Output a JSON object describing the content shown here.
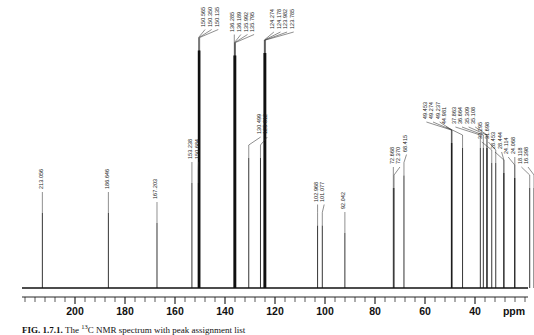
{
  "figure": {
    "caption_label": "FIG. 1.7.1.",
    "caption_text": "The 13C NMR spectrum with peak assignment list",
    "x_axis_unit": "ppm"
  },
  "axis": {
    "unit_label": "ppm",
    "tick_labels": [
      "200",
      "180",
      "160",
      "140",
      "120",
      "100",
      "80",
      "60",
      "40"
    ],
    "tick_values": [
      200,
      180,
      160,
      140,
      120,
      100,
      80,
      60,
      40
    ],
    "range_min": 8,
    "range_max": 220,
    "direction": "reversed",
    "minor_ticks_per_major": 4
  },
  "chart_data": {
    "type": "line",
    "title": "13C NMR spectrum",
    "xlabel": "ppm",
    "ylabel": "",
    "xlim": [
      220,
      8
    ],
    "ylim": [
      0,
      1
    ],
    "grid": false,
    "legend": "none",
    "x": [
      213.056,
      186.646,
      167.203,
      153.238,
      150.684,
      150.565,
      150.35,
      150.135,
      136.285,
      136.189,
      135.992,
      135.795,
      130.499,
      125.812,
      124.274,
      124.178,
      123.982,
      123.785,
      102.968,
      101.077,
      92.042,
      72.668,
      72.37,
      68.415,
      49.453,
      49.274,
      49.237,
      44.981,
      37.863,
      36.664,
      35.309,
      35.108,
      33.295,
      31.698,
      28.444,
      28.453,
      24.114,
      24.068,
      18.118,
      16.398
    ],
    "peaks": [
      {
        "ppm": 213.056,
        "label": "213.056",
        "height": 0.3
      },
      {
        "ppm": 186.646,
        "label": "186.646",
        "height": 0.3
      },
      {
        "ppm": 167.203,
        "label": "167.203",
        "height": 0.26
      },
      {
        "ppm": 153.238,
        "label": "153.238",
        "height": 0.42
      },
      {
        "ppm": 150.684,
        "label": "150.684",
        "height": 0.42
      },
      {
        "ppm": 150.565,
        "label": "150.565",
        "height": 0.95
      },
      {
        "ppm": 150.35,
        "label": "150.350",
        "height": 0.95
      },
      {
        "ppm": 150.135,
        "label": "150.135",
        "height": 0.95
      },
      {
        "ppm": 136.285,
        "label": "136.285",
        "height": 0.93
      },
      {
        "ppm": 136.189,
        "label": "136.189",
        "height": 0.93
      },
      {
        "ppm": 135.992,
        "label": "135.992",
        "height": 0.93
      },
      {
        "ppm": 135.795,
        "label": "135.795",
        "height": 0.93
      },
      {
        "ppm": 130.499,
        "label": "130.499",
        "height": 0.52
      },
      {
        "ppm": 125.812,
        "label": "125.812",
        "height": 0.52
      },
      {
        "ppm": 124.274,
        "label": "124.274",
        "height": 0.94
      },
      {
        "ppm": 124.178,
        "label": "124.178",
        "height": 0.94
      },
      {
        "ppm": 123.982,
        "label": "123.982",
        "height": 0.94
      },
      {
        "ppm": 123.785,
        "label": "123.785",
        "height": 0.94
      },
      {
        "ppm": 102.968,
        "label": "102.968",
        "height": 0.25
      },
      {
        "ppm": 101.077,
        "label": "101.077",
        "height": 0.25
      },
      {
        "ppm": 92.042,
        "label": "92.042",
        "height": 0.22
      },
      {
        "ppm": 72.668,
        "label": "72.668",
        "height": 0.4
      },
      {
        "ppm": 72.37,
        "label": "72.370",
        "height": 0.4
      },
      {
        "ppm": 68.415,
        "label": "68.415",
        "height": 0.45
      },
      {
        "ppm": 49.453,
        "label": "49.453",
        "height": 0.58
      },
      {
        "ppm": 49.274,
        "label": "49.274",
        "height": 0.58
      },
      {
        "ppm": 49.237,
        "label": "49.237",
        "height": 0.58
      },
      {
        "ppm": 44.981,
        "label": "44.981",
        "height": 0.56
      },
      {
        "ppm": 37.863,
        "label": "37.863",
        "height": 0.56
      },
      {
        "ppm": 36.664,
        "label": "36.664",
        "height": 0.56
      },
      {
        "ppm": 35.309,
        "label": "35.309",
        "height": 0.56
      },
      {
        "ppm": 35.108,
        "label": "35.108",
        "height": 0.56
      },
      {
        "ppm": 33.295,
        "label": "33.295",
        "height": 0.5
      },
      {
        "ppm": 31.698,
        "label": "31.698",
        "height": 0.5
      },
      {
        "ppm": 28.444,
        "label": "28.444",
        "height": 0.46
      },
      {
        "ppm": 28.453,
        "label": "28.453",
        "height": 0.46
      },
      {
        "ppm": 24.114,
        "label": "24.114",
        "height": 0.44
      },
      {
        "ppm": 24.068,
        "label": "24.068",
        "height": 0.44
      },
      {
        "ppm": 18.118,
        "label": "18.118",
        "height": 0.4
      },
      {
        "ppm": 16.398,
        "label": "16.398",
        "height": 0.4
      }
    ]
  },
  "colors": {
    "trace": "#111111",
    "axis": "#111111",
    "label": "#1a1a1a",
    "background": "#ffffff"
  }
}
